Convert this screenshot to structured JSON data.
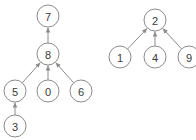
{
  "diagram": {
    "type": "directed-graph",
    "background_color": "#ffffff",
    "node_fill_color": "#ffffff",
    "node_stroke_color": "#8c8c8c",
    "edge_color": "#8c8c8c",
    "label_color": "#3a3a3a",
    "node_radius": 11,
    "nodes": [
      {
        "id": "n7",
        "label": "7",
        "x": 48,
        "y": 16
      },
      {
        "id": "n8",
        "label": "8",
        "x": 48,
        "y": 54
      },
      {
        "id": "n5",
        "label": "5",
        "x": 15,
        "y": 91
      },
      {
        "id": "n0",
        "label": "0",
        "x": 48,
        "y": 91
      },
      {
        "id": "n6",
        "label": "6",
        "x": 81,
        "y": 91
      },
      {
        "id": "n3",
        "label": "3",
        "x": 15,
        "y": 126
      },
      {
        "id": "n2",
        "label": "2",
        "x": 155,
        "y": 20
      },
      {
        "id": "n1",
        "label": "1",
        "x": 120,
        "y": 57
      },
      {
        "id": "n4",
        "label": "4",
        "x": 155,
        "y": 57
      },
      {
        "id": "n9",
        "label": "9",
        "x": 189,
        "y": 57
      }
    ],
    "edges": [
      {
        "id": "e8-7",
        "from": "n8",
        "to": "n7",
        "directed": true
      },
      {
        "id": "e5-8",
        "from": "n5",
        "to": "n8",
        "directed": true
      },
      {
        "id": "e0-8",
        "from": "n0",
        "to": "n8",
        "directed": true
      },
      {
        "id": "e6-8",
        "from": "n6",
        "to": "n8",
        "directed": true
      },
      {
        "id": "e3-5",
        "from": "n3",
        "to": "n5",
        "directed": true
      },
      {
        "id": "e1-2",
        "from": "n1",
        "to": "n2",
        "directed": true
      },
      {
        "id": "e4-2",
        "from": "n4",
        "to": "n2",
        "directed": true
      },
      {
        "id": "e9-2",
        "from": "n9",
        "to": "n2",
        "directed": true
      }
    ]
  }
}
